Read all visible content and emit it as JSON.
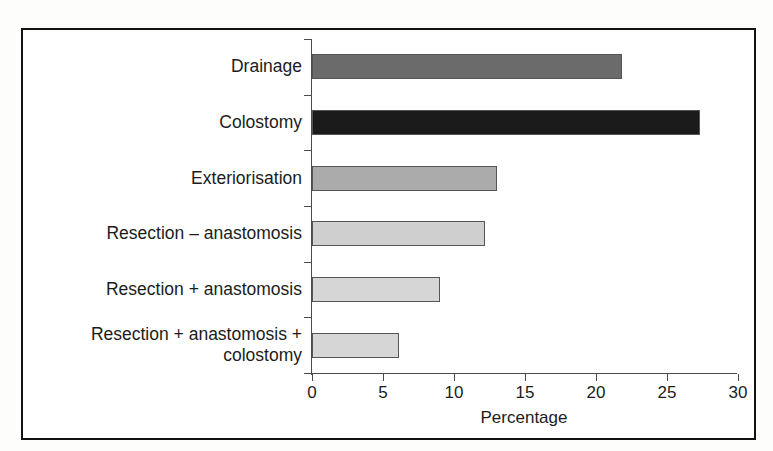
{
  "figure": {
    "frame_color": "#121212",
    "background": "#ffffff"
  },
  "chart_data": {
    "type": "bar",
    "orientation": "horizontal",
    "title": "",
    "subtitle": "",
    "xlabel": "Percentage",
    "ylabel": "",
    "xlim": [
      0,
      30
    ],
    "ylim": null,
    "grid": false,
    "legend": null,
    "xticks": [
      0,
      5,
      10,
      15,
      20,
      25,
      30
    ],
    "xtick_labels": [
      "0",
      "5",
      "10",
      "15",
      "20",
      "25",
      "30"
    ],
    "categories": [
      "Drainage",
      "Colostomy",
      "Exteriorisation",
      "Resection – anastomosis",
      "Resection + anastomosis",
      "Resection + anastomosis +\ncolostomy"
    ],
    "values": [
      21.8,
      27.3,
      13.0,
      12.2,
      9.0,
      6.1
    ],
    "bar_colors": [
      "#6b6b6b",
      "#1b1b1b",
      "#ababab",
      "#cfcfcf",
      "#d6d6d6",
      "#d6d6d6"
    ],
    "bar_edge_color": "#555555",
    "annotations": []
  },
  "axis": {
    "x_title": "Percentage",
    "line_color": "#4a4a4a"
  }
}
